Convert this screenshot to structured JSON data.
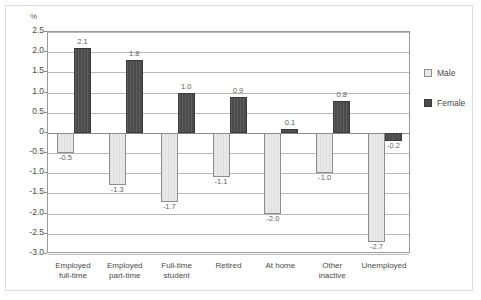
{
  "chart_data": {
    "type": "bar",
    "title": "",
    "subtitle": "",
    "xlabel": "",
    "ylabel": "%",
    "ylim": [
      -3.0,
      2.5
    ],
    "ytick_labels": [
      "2.5",
      "2.0",
      "1.5",
      "1.0",
      "0.5",
      "0",
      "-0.5",
      "-1.0",
      "-1.5",
      "-2.0",
      "-2.5",
      "-3.0"
    ],
    "ytick_values": [
      2.5,
      2.0,
      1.5,
      1.0,
      0.5,
      0,
      -0.5,
      -1.0,
      -1.5,
      -2.0,
      -2.5,
      -3.0
    ],
    "grid": true,
    "legend_position": "right",
    "categories": [
      "Employed full-time",
      "Employed part-time",
      "Full-time student",
      "Retired",
      "At home",
      "Other inactive",
      "Unemployed"
    ],
    "category_lines": [
      [
        "Employed",
        "full-time"
      ],
      [
        "Employed",
        "part-time"
      ],
      [
        "Full-time",
        "student"
      ],
      [
        "Retired"
      ],
      [
        "At home"
      ],
      [
        "Other",
        "inactive"
      ],
      [
        "Unemployed"
      ]
    ],
    "series": [
      {
        "name": "Male",
        "color": "#e9e9e9",
        "values": [
          -0.5,
          -1.3,
          -1.7,
          -1.1,
          -2.0,
          -1.0,
          -2.7
        ],
        "labels": [
          "-0.5",
          "-1.3",
          "-1.7",
          "-1.1",
          "-2.0",
          "-1.0",
          "-2.7"
        ]
      },
      {
        "name": "Female",
        "color": "#4b4b4b",
        "values": [
          2.1,
          1.8,
          1.0,
          0.9,
          0.1,
          0.8,
          -0.2
        ],
        "labels": [
          "2.1",
          "1.8",
          "1.0",
          "0.9",
          "0.1",
          "0.8",
          "-0.2"
        ]
      }
    ]
  },
  "legend": {
    "items": [
      {
        "label": "Male",
        "swatch": "male"
      },
      {
        "label": "Female",
        "swatch": "female"
      }
    ]
  },
  "axis": {
    "unit_label": "%"
  }
}
